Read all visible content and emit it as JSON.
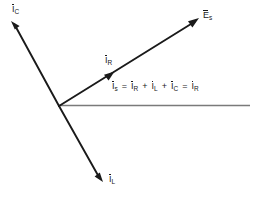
{
  "diagram": {
    "background_color": "#ffffff",
    "vector_color": "#1a1a1a",
    "reference_line_color": "#7a7a7a",
    "origin": {
      "x": 59,
      "y": 106
    },
    "vectors": [
      {
        "id": "ic",
        "name": "capacitive-current",
        "symbol": "I",
        "subscript": "C",
        "label": "I̅C",
        "tip": {
          "x": 11,
          "y": 21
        },
        "arrowhead": true,
        "color": "#1a1a1a",
        "label_pos": {
          "x": 12,
          "y": 4
        }
      },
      {
        "id": "es",
        "name": "source-voltage",
        "symbol": "E",
        "subscript": "s",
        "label": "E̅s",
        "tip": {
          "x": 199,
          "y": 18
        },
        "arrowhead": true,
        "color": "#1a1a1a",
        "label_pos": {
          "x": 203,
          "y": 10
        }
      },
      {
        "id": "il",
        "name": "inductive-current",
        "symbol": "I",
        "subscript": "L",
        "label": "I̅L",
        "tip": {
          "x": 103,
          "y": 182
        },
        "arrowhead": true,
        "color": "#1a1a1a",
        "label_pos": {
          "x": 109,
          "y": 175
        }
      },
      {
        "id": "ir",
        "name": "resistive-current",
        "symbol": "I",
        "subscript": "R",
        "label": "I̅R",
        "tip": {
          "x": 113,
          "y": 73
        },
        "arrowhead": true,
        "color": "#1a1a1a",
        "label_pos": {
          "x": 105,
          "y": 55
        }
      }
    ],
    "reference_line": {
      "name": "horizontal-reference-axis",
      "from": {
        "x": 59,
        "y": 105
      },
      "to": {
        "x": 250,
        "y": 105
      },
      "color": "#7a7a7a",
      "arrowhead": false
    },
    "equation": {
      "position": {
        "x": 112,
        "y": 81
      },
      "text": "I̅s = I̅R + I̅L + I̅C = I̅R",
      "terms": [
        {
          "symbol": "I",
          "subscript": "s"
        },
        {
          "operator": "="
        },
        {
          "symbol": "I",
          "subscript": "R"
        },
        {
          "operator": "+"
        },
        {
          "symbol": "I",
          "subscript": "L"
        },
        {
          "operator": "+"
        },
        {
          "symbol": "I",
          "subscript": "C"
        },
        {
          "operator": "="
        },
        {
          "symbol": "I",
          "subscript": "R"
        }
      ]
    }
  }
}
